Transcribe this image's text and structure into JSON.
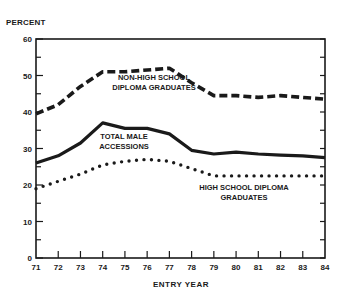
{
  "chart_data": {
    "type": "line",
    "title": "",
    "ylabel": "PERCENT",
    "xlabel": "ENTRY YEAR",
    "ylim": [
      0,
      60
    ],
    "yticks": [
      0,
      10,
      20,
      30,
      40,
      50,
      60
    ],
    "x": [
      71,
      72,
      73,
      74,
      75,
      76,
      77,
      78,
      79,
      80,
      81,
      82,
      83,
      84
    ],
    "grid": false,
    "legend": "inline annotations",
    "series": [
      {
        "name": "NON-HIGH SCHOOL DIPLOMA GRADUATES",
        "style": "dashed",
        "values": [
          39.5,
          42,
          47,
          51,
          51,
          51.5,
          52,
          48,
          44.5,
          44.5,
          44,
          44.5,
          44,
          43.5
        ]
      },
      {
        "name": "TOTAL MALE ACCESSIONS",
        "style": "solid",
        "values": [
          26,
          28,
          31.5,
          37,
          35.5,
          35.5,
          34,
          29.5,
          28.5,
          29,
          28.5,
          28.2,
          28,
          27.5
        ]
      },
      {
        "name": "HIGH SCHOOL DIPLOMA GRADUATES",
        "style": "dotted",
        "values": [
          19,
          21,
          23,
          25.5,
          26.5,
          27,
          26.5,
          24.5,
          22.5,
          22.5,
          22.5,
          22.5,
          22.5,
          22.5
        ]
      }
    ],
    "annotations": [
      {
        "lines": [
          "NON-HIGH SCHOOL",
          "DIPLOMA GRADUATES"
        ]
      },
      {
        "lines": [
          "TOTAL MALE",
          "ACCESSIONS"
        ]
      },
      {
        "lines": [
          "HIGH SCHOOL DIPLOMA",
          "GRADUATES"
        ]
      }
    ]
  },
  "labels": {
    "y_axis_title": "PERCENT",
    "x_axis_title": "ENTRY YEAR",
    "nonhs_1": "NON-HIGH SCHOOL",
    "nonhs_2": "DIPLOMA GRADUATES",
    "total_1": "TOTAL MALE",
    "total_2": "ACCESSIONS",
    "hs_1": "HIGH SCHOOL DIPLOMA",
    "hs_2": "GRADUATES"
  }
}
